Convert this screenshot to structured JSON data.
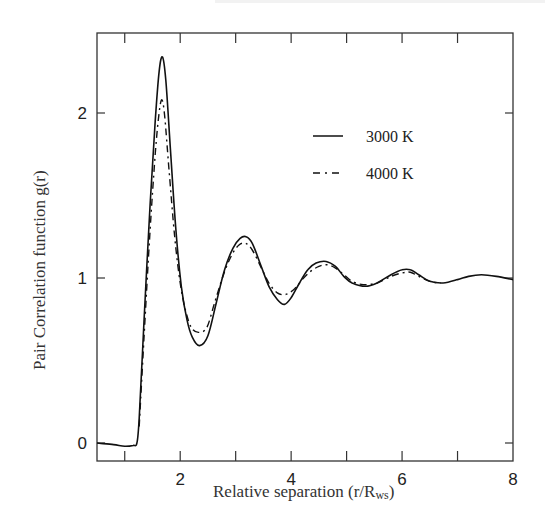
{
  "chart_data": {
    "type": "line",
    "title": "",
    "xlabel": "Relative separation  (r/R",
    "xlabel_sub": "ws",
    "xlabel_close": ")",
    "ylabel": "Pair Correlation function g(r)",
    "xlim": [
      0.5,
      8
    ],
    "ylim": [
      -0.1,
      2.5
    ],
    "xticks_major": [
      2,
      4,
      6,
      8
    ],
    "xticks_minor": [
      1,
      3,
      5,
      7
    ],
    "yticks": [
      0,
      1,
      2
    ],
    "grid": false,
    "legend_position": "upper right",
    "series": [
      {
        "name": "3000 K",
        "style": "solid",
        "points": [
          [
            0.5,
            0.0
          ],
          [
            0.8,
            -0.01
          ],
          [
            1.0,
            -0.02
          ],
          [
            1.15,
            -0.015
          ],
          [
            1.22,
            0.0
          ],
          [
            1.26,
            0.15
          ],
          [
            1.35,
            0.75
          ],
          [
            1.45,
            1.4
          ],
          [
            1.55,
            1.95
          ],
          [
            1.62,
            2.25
          ],
          [
            1.68,
            2.34
          ],
          [
            1.74,
            2.2
          ],
          [
            1.82,
            1.8
          ],
          [
            1.92,
            1.3
          ],
          [
            2.02,
            0.95
          ],
          [
            2.12,
            0.75
          ],
          [
            2.22,
            0.64
          ],
          [
            2.35,
            0.59
          ],
          [
            2.5,
            0.65
          ],
          [
            2.65,
            0.85
          ],
          [
            2.8,
            1.05
          ],
          [
            2.95,
            1.18
          ],
          [
            3.08,
            1.24
          ],
          [
            3.19,
            1.25
          ],
          [
            3.3,
            1.21
          ],
          [
            3.45,
            1.08
          ],
          [
            3.6,
            0.95
          ],
          [
            3.75,
            0.87
          ],
          [
            3.88,
            0.84
          ],
          [
            4.0,
            0.88
          ],
          [
            4.15,
            0.97
          ],
          [
            4.3,
            1.05
          ],
          [
            4.45,
            1.09
          ],
          [
            4.63,
            1.1
          ],
          [
            4.8,
            1.07
          ],
          [
            4.95,
            1.01
          ],
          [
            5.1,
            0.97
          ],
          [
            5.34,
            0.95
          ],
          [
            5.55,
            0.97
          ],
          [
            5.8,
            1.02
          ],
          [
            6.0,
            1.05
          ],
          [
            6.15,
            1.05
          ],
          [
            6.3,
            1.02
          ],
          [
            6.5,
            0.98
          ],
          [
            6.74,
            0.97
          ],
          [
            7.0,
            0.99
          ],
          [
            7.2,
            1.01
          ],
          [
            7.43,
            1.02
          ],
          [
            7.7,
            1.01
          ],
          [
            8.0,
            0.99
          ]
        ]
      },
      {
        "name": "4000 K",
        "style": "dashdot",
        "points": [
          [
            1.26,
            0.1
          ],
          [
            1.35,
            0.65
          ],
          [
            1.45,
            1.25
          ],
          [
            1.55,
            1.75
          ],
          [
            1.62,
            2.0
          ],
          [
            1.67,
            2.08
          ],
          [
            1.72,
            1.98
          ],
          [
            1.8,
            1.65
          ],
          [
            1.9,
            1.25
          ],
          [
            2.0,
            0.97
          ],
          [
            2.1,
            0.8
          ],
          [
            2.2,
            0.7
          ],
          [
            2.33,
            0.67
          ],
          [
            2.48,
            0.7
          ],
          [
            2.62,
            0.85
          ],
          [
            2.78,
            1.02
          ],
          [
            2.93,
            1.14
          ],
          [
            3.06,
            1.2
          ],
          [
            3.18,
            1.21
          ],
          [
            3.3,
            1.17
          ],
          [
            3.45,
            1.07
          ],
          [
            3.6,
            0.97
          ],
          [
            3.75,
            0.91
          ],
          [
            3.9,
            0.9
          ],
          [
            4.05,
            0.93
          ],
          [
            4.2,
            0.99
          ],
          [
            4.35,
            1.04
          ],
          [
            4.5,
            1.07
          ],
          [
            4.65,
            1.08
          ],
          [
            4.8,
            1.06
          ],
          [
            4.95,
            1.02
          ],
          [
            5.1,
            0.98
          ],
          [
            5.3,
            0.96
          ],
          [
            5.55,
            0.97
          ],
          [
            5.8,
            1.01
          ],
          [
            6.0,
            1.03
          ],
          [
            6.15,
            1.035
          ],
          [
            6.3,
            1.01
          ],
          [
            6.5,
            0.98
          ],
          [
            6.7,
            0.97
          ]
        ]
      }
    ]
  },
  "legend": {
    "items": [
      {
        "label": "3000 K",
        "style": "solid"
      },
      {
        "label": "4000 K",
        "style": "dashdot"
      }
    ]
  },
  "colors": {
    "line": "#111111",
    "axis": "#333333",
    "background": "#ffffff"
  }
}
